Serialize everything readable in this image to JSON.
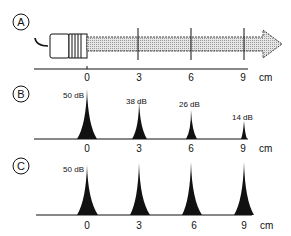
{
  "figure": {
    "panels": [
      {
        "id": "A",
        "label": "A",
        "description": "transducer with ultrasound beam arrow"
      },
      {
        "id": "B",
        "label": "B",
        "description": "echo amplitudes decreasing with depth"
      },
      {
        "id": "C",
        "label": "C",
        "description": "echo amplitudes equalized"
      }
    ],
    "axis": {
      "ticks": [
        "0",
        "3",
        "6",
        "9"
      ],
      "unit": "cm"
    },
    "panel_b": {
      "echoes": [
        {
          "position": "0",
          "level": "50 dB"
        },
        {
          "position": "3",
          "level": "38 dB"
        },
        {
          "position": "6",
          "level": "26 dB"
        },
        {
          "position": "9",
          "level": "14 dB"
        }
      ]
    },
    "panel_c": {
      "echoes": [
        {
          "position": "0",
          "level": "50 dB"
        },
        {
          "position": "3",
          "level": ""
        },
        {
          "position": "6",
          "level": ""
        },
        {
          "position": "9",
          "level": ""
        }
      ]
    }
  }
}
